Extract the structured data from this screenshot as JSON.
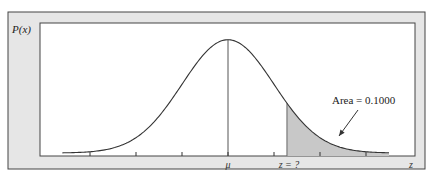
{
  "chart_data": {
    "type": "area",
    "title": "",
    "ylabel": "P(x)",
    "xlabel": "z",
    "distribution": "normal",
    "mean": 0,
    "std": 1,
    "xlim": [
      -3.25,
      3.5
    ],
    "tick_values": [
      -3,
      -2,
      -1,
      0,
      1,
      2,
      3
    ],
    "tick_labels": [
      {
        "value": 0,
        "label": "μ"
      },
      {
        "value": 1.2816,
        "label": "z = ?"
      }
    ],
    "shaded_region": {
      "from": 1.2816,
      "to": 3.5,
      "tail": "right"
    },
    "annotation": {
      "text": "Area = 0.1000",
      "area": 0.1
    },
    "curve_range": [
      -3.6,
      3.5
    ],
    "colors": {
      "frame": "#e6e6e6",
      "frame_border": "#444444",
      "plot_bg": "#ffffff",
      "curve": "#333333",
      "shade": "#c8c8c8"
    }
  }
}
